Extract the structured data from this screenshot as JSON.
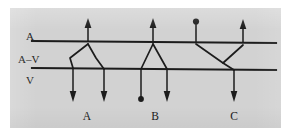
{
  "figure": {
    "caption_present": false,
    "background_color": "#d2d2d2",
    "ink_color": "#1c1c1c",
    "level_labels": [
      {
        "id": "arterial",
        "text": "A",
        "x": 16,
        "y": 32
      },
      {
        "id": "arteriovenous",
        "text": "A–V",
        "x": 10,
        "y": 55
      },
      {
        "id": "venous",
        "text": "V",
        "x": 16,
        "y": 76
      }
    ],
    "group_labels": [
      {
        "id": "group-a",
        "text": "A",
        "x": 80,
        "y": 112
      },
      {
        "id": "group-b",
        "text": "B",
        "x": 152,
        "y": 112
      },
      {
        "id": "group-c",
        "text": "C",
        "x": 227,
        "y": 112
      }
    ],
    "vessel_lines": [
      {
        "id": "arterial-line",
        "x1": 22,
        "y1": 33,
        "x2": 266,
        "y2": 35
      },
      {
        "id": "venous-line",
        "x1": 22,
        "y1": 60,
        "x2": 266,
        "y2": 62
      }
    ],
    "inflow_arrows": [
      {
        "id": "inflow-a1",
        "x": 78,
        "y_tail": 33,
        "y_head": 11,
        "head": "arrow"
      },
      {
        "id": "inflow-b1",
        "x": 143,
        "y_tail": 34,
        "y_head": 11,
        "head": "arrow"
      },
      {
        "id": "inflow-c1",
        "x": 186,
        "y_tail": 35,
        "y_head": 12,
        "head": "dot"
      },
      {
        "id": "inflow-c2",
        "x": 233,
        "y_tail": 35,
        "y_head": 12,
        "head": "arrow"
      }
    ],
    "outflow_arrows": [
      {
        "id": "outflow-a1",
        "x": 63,
        "y_tail": 60,
        "y_head": 93,
        "head": "arrow"
      },
      {
        "id": "outflow-a2",
        "x": 94,
        "y_tail": 61,
        "y_head": 93,
        "head": "arrow"
      },
      {
        "id": "outflow-b1",
        "x": 131,
        "y_tail": 61,
        "y_head": 93,
        "head": "dot"
      },
      {
        "id": "outflow-b2",
        "x": 157,
        "y_tail": 61,
        "y_head": 93,
        "head": "arrow"
      },
      {
        "id": "outflow-c1",
        "x": 224,
        "y_tail": 62,
        "y_head": 93,
        "head": "arrow"
      }
    ],
    "shunts": [
      {
        "id": "shunt-group-a",
        "label": "A",
        "paths": [
          "M 78 36 L 60 50 L 63 60",
          "M 78 36 L 86 50 L 94 61"
        ]
      },
      {
        "id": "shunt-group-b",
        "label": "B",
        "paths": [
          "M 143 36 L 131 61",
          "M 143 36 L 157 61"
        ]
      },
      {
        "id": "shunt-group-c",
        "label": "C",
        "paths": [
          "M 186 36 L 213 55 L 224 62",
          "M 233 37 L 213 55"
        ]
      }
    ]
  }
}
